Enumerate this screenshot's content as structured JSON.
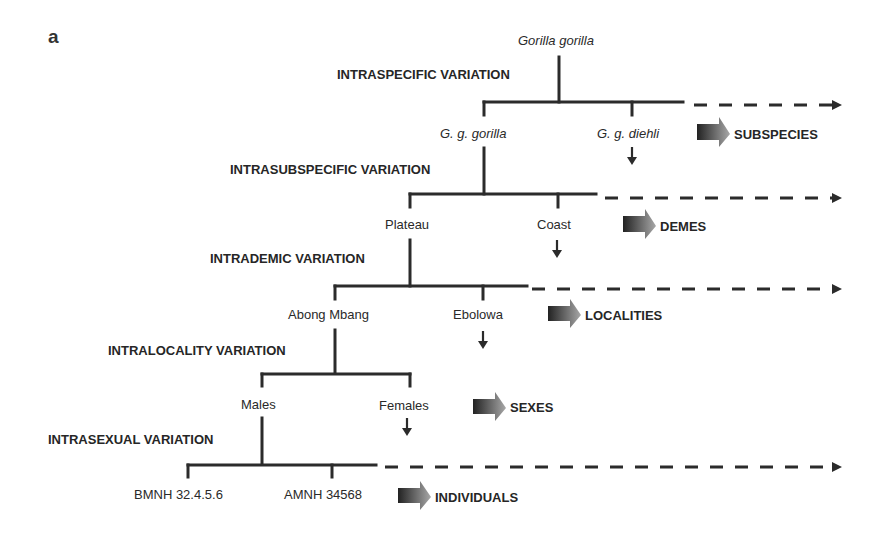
{
  "figure": {
    "panel_label": "a",
    "root": "Gorilla gorilla",
    "levels": [
      {
        "variation": "INTRASPECIFIC VARIATION",
        "nodes": [
          "G. g. gorilla",
          "G. g. diehli"
        ],
        "category": "SUBSPECIES"
      },
      {
        "variation": "INTRASUBSPECIFIC VARIATION",
        "nodes": [
          "Plateau",
          "Coast"
        ],
        "category": "DEMES"
      },
      {
        "variation": "INTRADEMIC VARIATION",
        "nodes": [
          "Abong Mbang",
          "Ebolowa"
        ],
        "category": "LOCALITIES"
      },
      {
        "variation": "INTRALOCALITY VARIATION",
        "nodes": [
          "Males",
          "Females"
        ],
        "category": "SEXES"
      },
      {
        "variation": "INTRASEXUAL VARIATION",
        "nodes": [
          "BMNH 32.4.5.6",
          "AMNH 34568"
        ],
        "category": "INDIVIDUALS"
      }
    ],
    "colors": {
      "line": "#2b2b2b",
      "arrow_dark": "#222222",
      "arrow_light": "#9a9a9a"
    },
    "icons": {
      "down-arrow": "↓",
      "category-arrow": "gradient-block-arrow",
      "dashed-arrow": "dashed-line-triangle"
    }
  }
}
